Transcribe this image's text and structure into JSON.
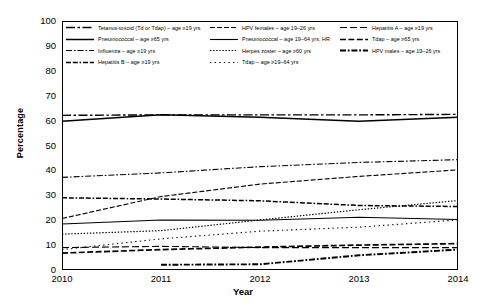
{
  "chart_data": {
    "type": "line",
    "title": "",
    "xlabel": "Year",
    "ylabel": "Percentage",
    "x": [
      2010,
      2011,
      2012,
      2013,
      2014
    ],
    "categories": [
      "2010",
      "2011",
      "2012",
      "2013",
      "2014"
    ],
    "xlim": [
      2010,
      2014
    ],
    "ylim": [
      0,
      100
    ],
    "yticks": [
      0,
      10,
      20,
      30,
      40,
      50,
      60,
      70,
      80,
      90,
      100
    ],
    "xticks": [
      "2010",
      "2011",
      "2012",
      "2013",
      "2014"
    ],
    "grid": false,
    "legend_position": "top-inside",
    "series": [
      {
        "name": "Tetanus-toxoid (Td or Tdap) – age ≥19 yrs",
        "style": "dash-dot-long",
        "values": [
          62.1,
          62.3,
          62.3,
          62.3,
          62.5
        ]
      },
      {
        "name": "Pneumococcal – age ≥65 yrs",
        "style": "solid-thick",
        "values": [
          59.7,
          62.3,
          61.3,
          59.7,
          61.3
        ]
      },
      {
        "name": "Influenza – age ≥19 yrs",
        "style": "dash-dot",
        "values": [
          37.2,
          39.0,
          41.5,
          43.2,
          44.3
        ]
      },
      {
        "name": "Hepatitis B – age ≥19 yrs",
        "style": "dash-dash-dot",
        "values": [
          29.0,
          28.5,
          27.8,
          25.9,
          25.5
        ]
      },
      {
        "name": "HPV females – age 19–26 yrs",
        "style": "dash-medium",
        "values": [
          20.7,
          29.5,
          34.5,
          37.6,
          40.2
        ]
      },
      {
        "name": "Pneumococcal – age 19–64 yrs, HR",
        "style": "solid-thin",
        "values": [
          18.5,
          20.1,
          20.0,
          21.2,
          20.3
        ]
      },
      {
        "name": "Herpes zoster – age ≥60 yrs",
        "style": "dotted-fine",
        "values": [
          14.4,
          15.8,
          20.1,
          24.2,
          27.9
        ]
      },
      {
        "name": "Tdap – age ≥19–64 yrs",
        "style": "dotted-sparse",
        "values": [
          8.2,
          12.5,
          15.6,
          17.2,
          20.1
        ]
      },
      {
        "name": "Hepatitis A – age ≥19 yrs",
        "style": "dash-long",
        "values": [
          9.0,
          9.5,
          9.0,
          9.0,
          9.0
        ]
      },
      {
        "name": "Tdap – age ≥65 yrs",
        "style": "dash-bold",
        "values": [
          6.8,
          8.2,
          9.2,
          10.0,
          10.6
        ]
      },
      {
        "name": "HPV males – age 19–26 yrs",
        "style": "dash-dot-bold",
        "values": [
          null,
          2.1,
          2.3,
          5.9,
          8.2
        ]
      }
    ]
  },
  "legend": {
    "columns": [
      [
        {
          "label": "Tetanus-toxoid (Td or Tdap) – age ≥19 yrs",
          "key": "dash-dot-long"
        },
        {
          "label": "Pneumococcal – age ≥65 yrs",
          "key": "solid-thick"
        },
        {
          "label": "Influenza – age ≥19 yrs",
          "key": "dash-dot"
        },
        {
          "label": "Hepatitis B – age ≥19 yrs",
          "key": "dash-dash-dot"
        }
      ],
      [
        {
          "label": "HPV females – age 19–26 yrs",
          "key": "dash-medium"
        },
        {
          "label": "Pneumococcal – age 19–64 yrs, HR",
          "key": "solid-thin"
        },
        {
          "label": "Herpes zoster – age ≥60 yrs",
          "key": "dotted-fine"
        },
        {
          "label": "Tdap – age ≥19–64 yrs",
          "key": "dotted-sparse"
        }
      ],
      [
        {
          "label": "Hepatitis A – age ≥19 yrs",
          "key": "dash-long"
        },
        {
          "label": "Tdap – age ≥65 yrs",
          "key": "dash-bold"
        },
        {
          "label": "HPV males – age 19–26 yrs",
          "key": "dash-dot-bold"
        }
      ]
    ]
  }
}
